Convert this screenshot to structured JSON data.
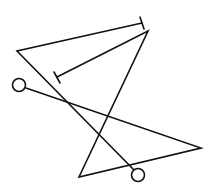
{
  "diagram": {
    "stroke_color": "#111111",
    "background_color": "#ffffff",
    "paths": [
      {
        "id": "path-a",
        "points": [
          [
            142,
            23
          ],
          [
            17,
            51
          ],
          [
            134,
            170
          ]
        ],
        "start_terminal": "t-bar",
        "end_terminal": "circle"
      },
      {
        "id": "path-b",
        "points": [
          [
            57,
            77
          ],
          [
            148,
            31
          ],
          [
            79,
            177
          ],
          [
            201,
            148
          ],
          [
            26,
            88
          ]
        ],
        "start_terminal": "t-bar",
        "end_terminal": "circle"
      }
    ],
    "terminals": {
      "t_bars": [
        {
          "id": "tbar-top",
          "from": [
            140,
            17
          ],
          "to": [
            144,
            29
          ]
        },
        {
          "id": "tbar-middle",
          "from": [
            54,
            72
          ],
          "to": [
            60,
            83
          ]
        }
      ],
      "circles": [
        {
          "id": "circle-left",
          "cx": 19,
          "cy": 85,
          "r": 6.5
        },
        {
          "id": "circle-bottom",
          "cx": 138,
          "cy": 175,
          "r": 6.5
        }
      ]
    }
  }
}
